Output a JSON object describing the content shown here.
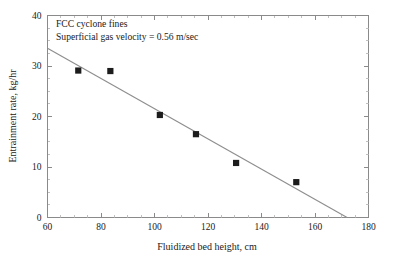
{
  "chart_data": {
    "type": "scatter",
    "title": "",
    "xlabel": "Fluidized bed height, cm",
    "ylabel": "Entrainment rate, kg/hr",
    "xlim": [
      60,
      180
    ],
    "ylim": [
      0,
      40
    ],
    "xticks": [
      60,
      80,
      100,
      120,
      140,
      160,
      180
    ],
    "yticks": [
      0,
      10,
      20,
      30,
      40
    ],
    "xtick_labels": [
      "60",
      "80",
      "100",
      "120",
      "140",
      "160",
      "180"
    ],
    "ytick_labels": [
      "0",
      "10",
      "20",
      "30",
      "40"
    ],
    "grid": false,
    "legend": false,
    "marker_style": "filled-square",
    "marker_color": "#1c1c1c",
    "line_color": "#8d8d8d",
    "frame_color": "#8a8a8a",
    "x": [
      71.5,
      83.5,
      102.0,
      115.5,
      130.5,
      153.0
    ],
    "y": [
      29.1,
      29.0,
      20.3,
      16.5,
      10.8,
      7.0
    ],
    "points": [
      {
        "x": 71.5,
        "y": 29.1
      },
      {
        "x": 83.5,
        "y": 29.0
      },
      {
        "x": 102.0,
        "y": 20.3
      },
      {
        "x": 115.5,
        "y": 16.5
      },
      {
        "x": 130.5,
        "y": 10.8
      },
      {
        "x": 153.0,
        "y": 7.0
      }
    ],
    "trendline": {
      "x0": 60.0,
      "y0": 33.5,
      "x1": 172.0,
      "y1": 0.0
    },
    "annotations": [
      "FCC cyclone fines",
      "Superficial gas velocity = 0.56 m/sec"
    ]
  }
}
